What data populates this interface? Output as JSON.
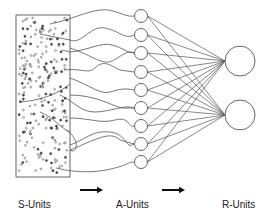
{
  "labels": {
    "s_units": "S-Units",
    "a_units": "A-Units",
    "r_units": "R-Units"
  },
  "colors": {
    "stroke": "#555555",
    "dot": "#444444",
    "background": "#ffffff"
  },
  "retina_box": {
    "x": 16,
    "y": 15,
    "width": 54,
    "height": 162
  },
  "a_units": {
    "cx": 141,
    "r": 6.5,
    "cy": [
      16,
      35,
      53,
      72,
      90,
      108,
      126,
      144,
      162
    ]
  },
  "r_units": {
    "cx": 240,
    "r": 15,
    "cy": [
      61,
      115
    ]
  },
  "arrows": [
    {
      "x1": 80,
      "x2": 103,
      "y": 190
    },
    {
      "x1": 162,
      "x2": 185,
      "y": 190
    }
  ]
}
